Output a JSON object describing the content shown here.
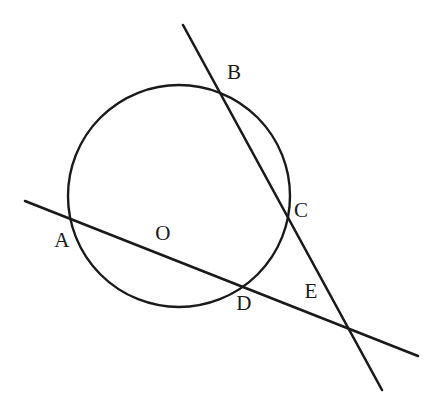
{
  "figure": {
    "type": "euclidean-geometry-diagram",
    "width": 444,
    "height": 398,
    "background_color": "#ffffff",
    "stroke_color": "#1a1a1a",
    "label_color": "#1a1a1a"
  },
  "circle": {
    "name": "circle-O",
    "center_x": 179,
    "center_y": 196,
    "radius": 111,
    "stroke_width": 2.4
  },
  "lines": [
    {
      "name": "secant-through-B-C",
      "x1": 183,
      "y1": 25,
      "x2": 382,
      "y2": 390,
      "stroke_width": 2.6,
      "passes_through": [
        "B",
        "C",
        "E"
      ]
    },
    {
      "name": "secant-through-A-D",
      "x1": 25,
      "y1": 201,
      "x2": 418,
      "y2": 356,
      "stroke_width": 2.6,
      "passes_through": [
        "A",
        "D",
        "E"
      ]
    }
  ],
  "points": [
    {
      "id": "A",
      "label": "A",
      "label_x": 62,
      "label_y": 240,
      "on_circle": true,
      "marker_x": 71,
      "marker_y": 222
    },
    {
      "id": "B",
      "label": "B",
      "label_x": 234,
      "label_y": 72,
      "on_circle": true,
      "marker_x": 222,
      "marker_y": 88
    },
    {
      "id": "C",
      "label": "C",
      "label_x": 301,
      "label_y": 210,
      "on_circle": true,
      "marker_x": 287,
      "marker_y": 215
    },
    {
      "id": "D",
      "label": "D",
      "label_x": 244,
      "label_y": 303,
      "on_circle": true,
      "marker_x": 240,
      "marker_y": 284
    },
    {
      "id": "E",
      "label": "E",
      "label_x": 311,
      "label_y": 291,
      "on_circle": false,
      "marker_x": 348,
      "marker_y": 325
    },
    {
      "id": "O",
      "label": "O",
      "label_x": 163,
      "label_y": 233,
      "on_circle": false,
      "marker_x": 179,
      "marker_y": 196
    }
  ]
}
